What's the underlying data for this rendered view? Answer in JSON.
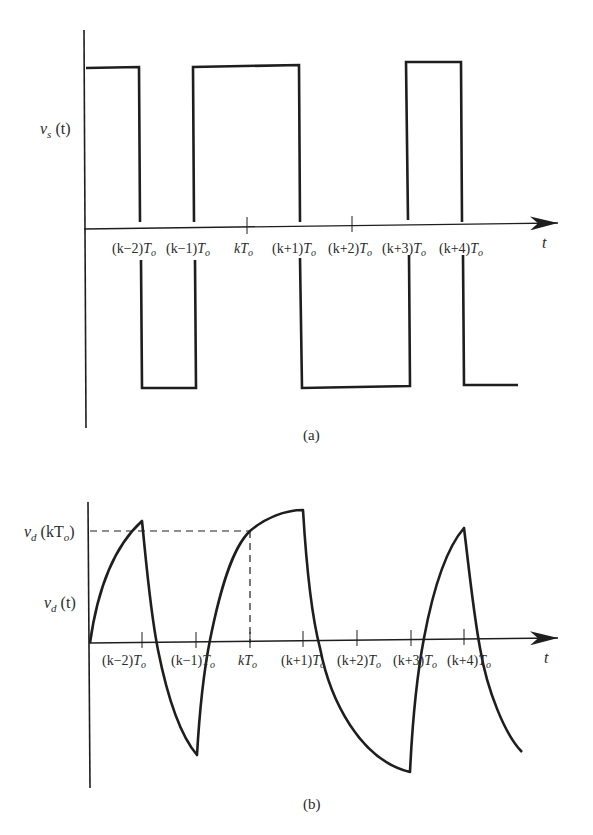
{
  "figure_a": {
    "caption": "(a)",
    "y_label": {
      "main": "v",
      "sub": "s",
      "arg": " (t)"
    },
    "x_label": "t",
    "ticks": [
      {
        "pre": "(k−2)",
        "T": "T",
        "sub": "o"
      },
      {
        "pre": "(k−1)",
        "T": "T",
        "sub": "o"
      },
      {
        "pre": "k",
        "T": "T",
        "sub": "o"
      },
      {
        "pre": "(k+1)",
        "T": "T",
        "sub": "o"
      },
      {
        "pre": "(k+2)",
        "T": "T",
        "sub": "o"
      },
      {
        "pre": "(k+3)",
        "T": "T",
        "sub": "o"
      },
      {
        "pre": "(k+4)",
        "T": "T",
        "sub": "o"
      }
    ],
    "waveform": "square wave, ±1 levels, transitions at (k−2)T₀, (k−1)T₀, (k+1)T₀, (k+3)T₀, (k+4)T₀"
  },
  "figure_b": {
    "caption": "(b)",
    "y_label": {
      "main": "v",
      "sub": "d",
      "arg": " (t)"
    },
    "level_label": {
      "main": "v",
      "sub": "d",
      "arg": " (kT",
      "argsub": "o",
      "close": ")"
    },
    "x_label": "t",
    "ticks": [
      {
        "pre": "(k−2)",
        "T": "T",
        "sub": "o"
      },
      {
        "pre": "(k−1)",
        "T": "T",
        "sub": "o"
      },
      {
        "pre": "k",
        "T": "T",
        "sub": "o"
      },
      {
        "pre": "(k+1)",
        "T": "T",
        "sub": "o"
      },
      {
        "pre": "(k+2)",
        "T": "T",
        "sub": "o"
      },
      {
        "pre": "(k+3)",
        "T": "T",
        "sub": "o"
      },
      {
        "pre": "(k+4)",
        "T": "T",
        "sub": "o"
      }
    ],
    "waveform": "integrated (RC-like) response of v_s(t); sampled value v_d(kT₀) marked with dashed lines"
  },
  "colors": {
    "ink": "#1e1e1e",
    "background": "#ffffff"
  }
}
